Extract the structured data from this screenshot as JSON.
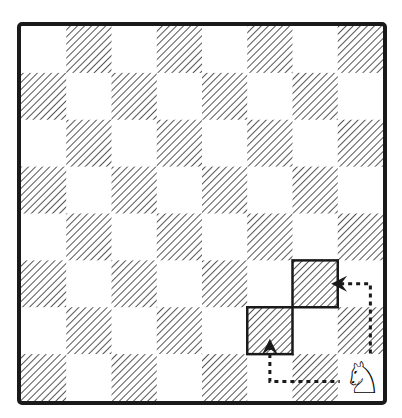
{
  "diagram": {
    "type": "chessboard",
    "files": 8,
    "ranks": 8,
    "shaded_square_style": "diagonal-hatch",
    "colors": {
      "border": "#1a1a1a",
      "hatch": "#555555",
      "light": "#ffffff",
      "path": "#1a1a1a"
    },
    "pieces": [
      {
        "name": "white-knight",
        "glyph": "♘",
        "square": "h1"
      }
    ],
    "highlighted_squares": [
      "f2",
      "g3"
    ],
    "arrows": [
      {
        "from": "h1",
        "to": "f2",
        "style": "dotted",
        "route": "left-then-up"
      },
      {
        "from": "h1",
        "to": "g3",
        "style": "dotted",
        "route": "up-then-left"
      }
    ]
  }
}
